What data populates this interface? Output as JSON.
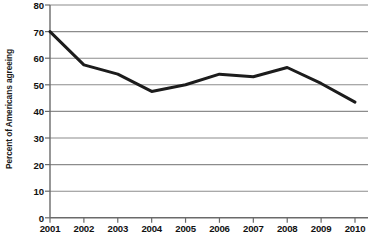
{
  "chart_data": {
    "type": "line",
    "title": "",
    "subtitle": "",
    "xlabel": "",
    "ylabel": "Percent of Americans agreeing",
    "categories": [
      "2001",
      "2002",
      "2003",
      "2004",
      "2005",
      "2006",
      "2007",
      "2008",
      "2009",
      "2010"
    ],
    "x": [
      2001,
      2002,
      2003,
      2004,
      2005,
      2006,
      2007,
      2008,
      2009,
      2010
    ],
    "values": [
      70,
      57.5,
      54,
      47.5,
      50,
      54,
      53,
      56.5,
      50.5,
      43.5
    ],
    "series": [
      {
        "name": "Percent of Americans agreeing",
        "values": [
          70,
          57.5,
          54,
          47.5,
          50,
          54,
          53,
          56.5,
          50.5,
          43.5
        ]
      }
    ],
    "ylim": [
      0,
      80
    ],
    "xlim": [
      2001,
      2010
    ],
    "yticks": [
      0,
      10,
      20,
      30,
      40,
      50,
      60,
      70,
      80
    ],
    "ytick_labels": [
      "0",
      "10",
      "20",
      "30",
      "40",
      "50",
      "60",
      "70",
      "80"
    ],
    "xticks": [
      2001,
      2002,
      2003,
      2004,
      2005,
      2006,
      2007,
      2008,
      2009,
      2010
    ],
    "xtick_labels": [
      "2001",
      "2002",
      "2003",
      "2004",
      "2005",
      "2006",
      "2007",
      "2008",
      "2009",
      "2010"
    ],
    "grid": "horizontal",
    "legend": "none",
    "annotations": [],
    "colors": {
      "line": "#1c1c1c",
      "grid": "#8c8c8c",
      "axis": "#5a5a5a",
      "text": "#111111",
      "background": "#ffffff"
    },
    "line_width": 3
  }
}
